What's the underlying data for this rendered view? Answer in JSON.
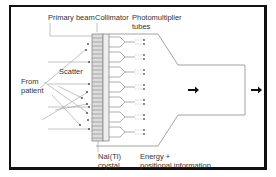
{
  "diagram": {
    "labels": {
      "primary_beam": "Primary beam",
      "collimator": "Collimator",
      "pmt_line1": "Photomultiplier",
      "pmt_line2": "tubes",
      "from_line1": "From",
      "from_line2": "patient",
      "scatter": "Scatter",
      "crystal_line1": "NaI(Tl)",
      "crystal_line2": "crystal",
      "output_line1": "Energy +",
      "output_line2": "positional information"
    },
    "colors": {
      "border": "#111111",
      "lines": "#9a9a9a",
      "text": "#333333",
      "arrows": "#111111"
    },
    "photomultiplier_tube_count": 6,
    "output_arrows": 2
  }
}
